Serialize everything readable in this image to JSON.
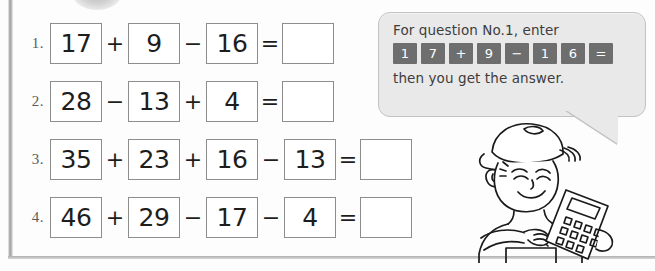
{
  "worksheet": {
    "rows": [
      {
        "number": "1.",
        "terms": [
          "17",
          "9",
          "16"
        ],
        "operators": [
          "+",
          "−"
        ],
        "equals": "=",
        "answer": ""
      },
      {
        "number": "2.",
        "terms": [
          "28",
          "13",
          "4"
        ],
        "operators": [
          "−",
          "+"
        ],
        "equals": "=",
        "answer": ""
      },
      {
        "number": "3.",
        "terms": [
          "35",
          "23",
          "16",
          "13"
        ],
        "operators": [
          "+",
          "+",
          "−"
        ],
        "equals": "=",
        "answer": ""
      },
      {
        "number": "4.",
        "terms": [
          "46",
          "29",
          "17",
          "4"
        ],
        "operators": [
          "+",
          "−",
          "−"
        ],
        "equals": "=",
        "answer": ""
      }
    ]
  },
  "bubble": {
    "line1": "For question No.1, enter",
    "line2": "then you get the answer.",
    "keys": [
      "1",
      "7",
      "+",
      "9",
      "−",
      "1",
      "6",
      "="
    ]
  },
  "illustration": {
    "character": "boy-with-calculator",
    "accessories": [
      "baseball-cap",
      "calculator"
    ]
  },
  "colors": {
    "bubble_background": "#e9e9e9",
    "bubble_border": "#c2c2c2",
    "key_background": "#6e6e6e",
    "key_text": "#ffffff",
    "box_border": "#8d8d8d",
    "text": "#1d1d1d",
    "rule": "#9a9a9a"
  }
}
